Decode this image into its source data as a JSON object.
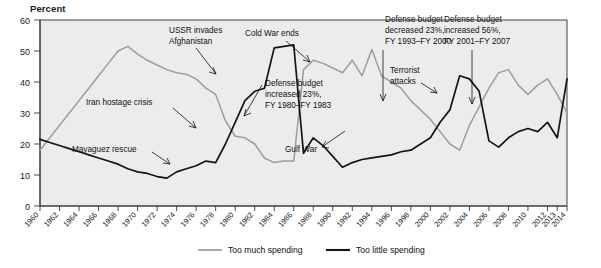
{
  "chart_data": {
    "type": "line",
    "title": "",
    "ylabel": "Percent",
    "xlabel": "",
    "ylim": [
      0,
      60
    ],
    "yticks": [
      0,
      10,
      20,
      30,
      40,
      50,
      60
    ],
    "grid": false,
    "legend_position": "bottom",
    "x": [
      1960,
      1961,
      1962,
      1963,
      1964,
      1965,
      1966,
      1967,
      1968,
      1969,
      1970,
      1971,
      1972,
      1973,
      1974,
      1975,
      1976,
      1977,
      1978,
      1979,
      1980,
      1981,
      1982,
      1983,
      1984,
      1985,
      1986,
      1987,
      1988,
      1989,
      1990,
      1991,
      1992,
      1993,
      1994,
      1995,
      1996,
      1997,
      1998,
      1999,
      2000,
      2001,
      2002,
      2003,
      2004,
      2005,
      2006,
      2007,
      2008,
      2009,
      2010,
      2011,
      2012,
      2013,
      2014
    ],
    "xtick_labels": [
      "1960",
      "1962",
      "1964",
      "1966",
      "1968",
      "1970",
      "1972",
      "1974",
      "1976",
      "1978",
      "1980",
      "1982",
      "1984",
      "1986",
      "1988",
      "1990",
      "1992",
      "1994",
      "1996",
      "1998",
      "2000",
      "2002",
      "2004",
      "2006",
      "2008",
      "2010",
      "2012",
      "2013",
      "2014"
    ],
    "series": [
      {
        "name": "Too much spending",
        "color": "#9d9d9d",
        "values": [
          18,
          22,
          26,
          30,
          34,
          38,
          42,
          46,
          50,
          51.5,
          49,
          47,
          45.5,
          44,
          43,
          42.5,
          41,
          38,
          36,
          27.5,
          22.5,
          22,
          20,
          15.5,
          14,
          14.5,
          14.5,
          44,
          47,
          46,
          44.5,
          43,
          47,
          42,
          50.5,
          42,
          40,
          38,
          34,
          31,
          28,
          24,
          20,
          18,
          26,
          32,
          38,
          43,
          44,
          39,
          36,
          39,
          41,
          36,
          30
        ]
      },
      {
        "name": "Too little spending",
        "color": "#151515",
        "values": [
          21.5,
          20.5,
          19.5,
          18.5,
          17.5,
          16.5,
          15.5,
          14.5,
          13.5,
          12,
          11,
          10.5,
          9.5,
          9,
          11,
          12,
          13,
          14.5,
          14,
          20,
          27,
          34,
          37,
          38,
          51,
          51.5,
          52,
          17,
          22,
          19.5,
          16,
          12.5,
          14,
          15,
          15.5,
          16,
          16.5,
          17.5,
          18,
          20,
          22,
          27,
          31,
          42,
          41,
          37,
          21,
          19,
          22,
          24,
          25,
          24,
          27,
          22,
          41
        ]
      }
    ],
    "annotations": [
      {
        "name": "iran-hostage-crisis",
        "text": "Iran hostage crisis"
      },
      {
        "name": "mayaguez-rescue",
        "text": "Mayaguez rescue"
      },
      {
        "name": "ussr-invades-afghanistan",
        "line1": "USSR invades",
        "line2": "Afghanistan"
      },
      {
        "name": "cold-war-ends",
        "text": "Cold War ends"
      },
      {
        "name": "defense-budget-increased-23",
        "line1": "Defense budget",
        "line2": "increased 23%,",
        "line3": "FY 1980–FY 1983"
      },
      {
        "name": "gulf-war",
        "text": "Gulf War"
      },
      {
        "name": "defense-budget-decreased-23",
        "line1": "Defense budget",
        "line2": "decreased 23%,",
        "line3": "FY 1993–FY 2000"
      },
      {
        "name": "terrorist-attacks",
        "line1": "Terrorist",
        "line2": "attacks"
      },
      {
        "name": "defense-budget-increased-56",
        "line1": "Defense budget",
        "line2": "increased 56%,",
        "line3": "FY 2001–FY 2007"
      }
    ]
  },
  "axis": {
    "y_title": "Percent",
    "y_labels": [
      "60",
      "50",
      "40",
      "30",
      "20",
      "10",
      "0"
    ],
    "x_labels": [
      "1960",
      "1962",
      "1964",
      "1966",
      "1968",
      "1970",
      "1972",
      "1974",
      "1976",
      "1978",
      "1980",
      "1982",
      "1984",
      "1986",
      "1988",
      "1990",
      "1992",
      "1994",
      "1996",
      "1998",
      "2000",
      "2002",
      "2004",
      "2006",
      "2008",
      "2010",
      "2012",
      "2013",
      "2014"
    ]
  },
  "legend": {
    "items": [
      {
        "label": "Too much spending",
        "color": "#9d9d9d"
      },
      {
        "label": "Too little spending",
        "color": "#151515"
      }
    ]
  },
  "annotations": {
    "iran": "Iran hostage crisis",
    "mayaguez": "Mayaguez rescue",
    "ussr_1": "USSR invades",
    "ussr_2": "Afghanistan",
    "coldwar": "Cold War ends",
    "inc23_1": "Defense budget",
    "inc23_2": "increased 23%,",
    "inc23_3": "FY 1980–FY 1983",
    "gulfwar": "Gulf War",
    "dec23_1": "Defense budget",
    "dec23_2": "decreased 23%,",
    "dec23_3": "FY 1993–FY 2000",
    "terror_1": "Terrorist",
    "terror_2": "attacks",
    "inc56_1": "Defense budget",
    "inc56_2": "increased 56%,",
    "inc56_3": "FY 2001–FY 2007"
  }
}
